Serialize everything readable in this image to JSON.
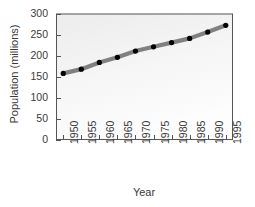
{
  "chart_data": {
    "type": "line",
    "title": "",
    "xlabel": "Year",
    "ylabel": "Population (millions)",
    "x": [
      1950,
      1955,
      1960,
      1965,
      1970,
      1975,
      1980,
      1985,
      1990,
      1995
    ],
    "values": [
      158,
      168,
      184,
      196,
      211,
      221,
      231,
      241,
      256,
      272
    ],
    "series": [
      {
        "name": "Population",
        "values": [
          158,
          168,
          184,
          196,
          211,
          221,
          231,
          241,
          256,
          272
        ]
      }
    ],
    "xtick_labels": [
      "1950",
      "1955",
      "1960",
      "1965",
      "1970",
      "1975",
      "1980",
      "1985",
      "1990",
      "1995"
    ],
    "ytick_labels": [
      "0",
      "50",
      "100",
      "150",
      "200",
      "250",
      "300"
    ],
    "ytick_values": [
      0,
      50,
      100,
      150,
      200,
      250,
      300
    ],
    "xlim": [
      1948,
      1997
    ],
    "ylim": [
      0,
      300
    ],
    "grid": false,
    "legend": "none",
    "line_color": "#808080",
    "marker_color": "#000000",
    "plot_bg_color": "#f2f2f2",
    "axis_color": "#555555",
    "text_color": "#3a3a3a"
  }
}
